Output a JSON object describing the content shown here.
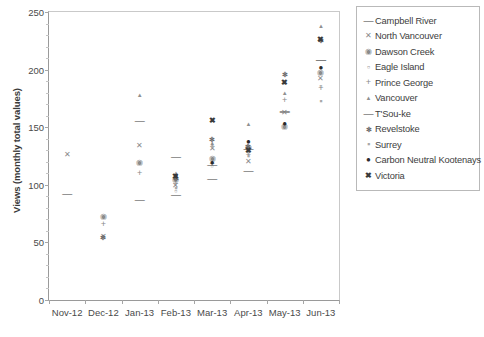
{
  "chart_data": {
    "type": "scatter",
    "title": "",
    "xlabel": "",
    "ylabel": "Views (monthly total values)",
    "ylim": [
      0,
      250
    ],
    "ytick_values": [
      0,
      50,
      100,
      150,
      200,
      250
    ],
    "ytick_labels": [
      "0",
      "50",
      "100",
      "150",
      "200",
      "250"
    ],
    "grid": false,
    "legend_position": "right",
    "categories": [
      "Nov-12",
      "Dec-12",
      "Jan-13",
      "Feb-13",
      "Mar-13",
      "Apr-13",
      "May-13",
      "Jun-13"
    ],
    "series": [
      {
        "name": "Campbell River",
        "marker": "dash",
        "glyph": "—",
        "values": [
          92,
          null,
          87,
          91,
          105,
          112,
          163,
          208
        ]
      },
      {
        "name": "North Vancouver",
        "marker": "x-thin",
        "glyph": "✕",
        "values": [
          126,
          55,
          134,
          99,
          131,
          120,
          162,
          192
        ]
      },
      {
        "name": "Dawson Creek",
        "marker": "circle-shaded",
        "glyph": "◉",
        "values": [
          null,
          72,
          119,
          104,
          122,
          132,
          150,
          197
        ]
      },
      {
        "name": "Eagle Island",
        "marker": "small-square",
        "glyph": "▫",
        "values": [
          null,
          null,
          null,
          95,
          116,
          128,
          151,
          186
        ]
      },
      {
        "name": "Prince George",
        "marker": "plus",
        "glyph": "+",
        "values": [
          null,
          66,
          110,
          101,
          118,
          126,
          174,
          184
        ]
      },
      {
        "name": "Vancouver",
        "marker": "triangle",
        "glyph": "▲",
        "values": [
          null,
          null,
          178,
          110,
          136,
          153,
          180,
          238
        ]
      },
      {
        "name": "T'Sou-ke",
        "marker": "dash",
        "glyph": "—",
        "values": [
          null,
          null,
          155,
          124,
          117,
          131,
          164,
          208
        ]
      },
      {
        "name": "Revelstoke",
        "marker": "star-x",
        "glyph": "✻",
        "values": [
          null,
          55,
          null,
          106,
          140,
          134,
          196,
          226
        ]
      },
      {
        "name": "Surrey",
        "marker": "square",
        "glyph": "▪",
        "values": [
          null,
          null,
          null,
          97,
          134,
          125,
          188,
          173
        ]
      },
      {
        "name": "Carbon Neutral Kootenays",
        "marker": "filled-dot",
        "glyph": "●",
        "values": [
          null,
          null,
          null,
          108,
          119,
          137,
          153,
          201
        ]
      },
      {
        "name": "Victoria",
        "marker": "bold-x",
        "glyph": "✖",
        "values": [
          null,
          null,
          null,
          107,
          155,
          129,
          188,
          226
        ]
      }
    ]
  },
  "legend": {
    "items": [
      {
        "label": "Campbell River",
        "glyph": "—"
      },
      {
        "label": "North Vancouver",
        "glyph": "✕"
      },
      {
        "label": "Dawson Creek",
        "glyph": "◉"
      },
      {
        "label": "Eagle Island",
        "glyph": "▫"
      },
      {
        "label": "Prince George",
        "glyph": "+"
      },
      {
        "label": "Vancouver",
        "glyph": "▲"
      },
      {
        "label": "T'Sou-ke",
        "glyph": "—"
      },
      {
        "label": "Revelstoke",
        "glyph": "✻"
      },
      {
        "label": "Surrey",
        "glyph": "▪"
      },
      {
        "label": "Carbon Neutral Kootenays",
        "glyph": "●"
      },
      {
        "label": "Victoria",
        "glyph": "✖"
      }
    ]
  }
}
